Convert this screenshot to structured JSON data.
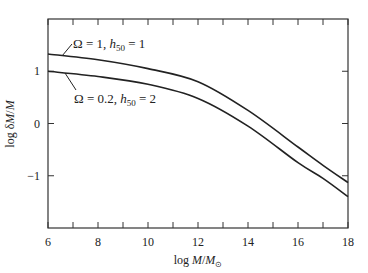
{
  "chart_data": {
    "type": "line",
    "title": "",
    "xlabel": "log M/M⊙",
    "ylabel": "log δM/M",
    "xlim": [
      6,
      18
    ],
    "ylim": [
      -2,
      2
    ],
    "x_ticks": [
      6,
      8,
      10,
      12,
      14,
      16,
      18
    ],
    "x_minor_ticks": [
      7,
      9,
      11,
      13,
      15,
      17
    ],
    "y_ticks": [
      -1,
      0,
      1
    ],
    "grid": false,
    "legend_position": "inline annotations",
    "series": [
      {
        "name": "Ω = 1, h50 = 1",
        "x": [
          6,
          8,
          10,
          12,
          14,
          16,
          17,
          18
        ],
        "values": [
          1.33,
          1.22,
          1.05,
          0.8,
          0.25,
          -0.45,
          -0.8,
          -1.13
        ]
      },
      {
        "name": "Ω = 0.2, h50 = 2",
        "x": [
          6,
          8,
          10,
          12,
          14,
          16,
          17,
          18
        ],
        "values": [
          1.0,
          0.9,
          0.75,
          0.48,
          -0.05,
          -0.75,
          -1.05,
          -1.4
        ]
      }
    ],
    "annotations": [
      {
        "text_main": "Ω = 1, ",
        "h": "h",
        "sub": "50",
        "text_end": " = 1"
      },
      {
        "text_main": "Ω = 0.2, ",
        "h": "h",
        "sub": "50",
        "text_end": " = 2"
      }
    ]
  }
}
